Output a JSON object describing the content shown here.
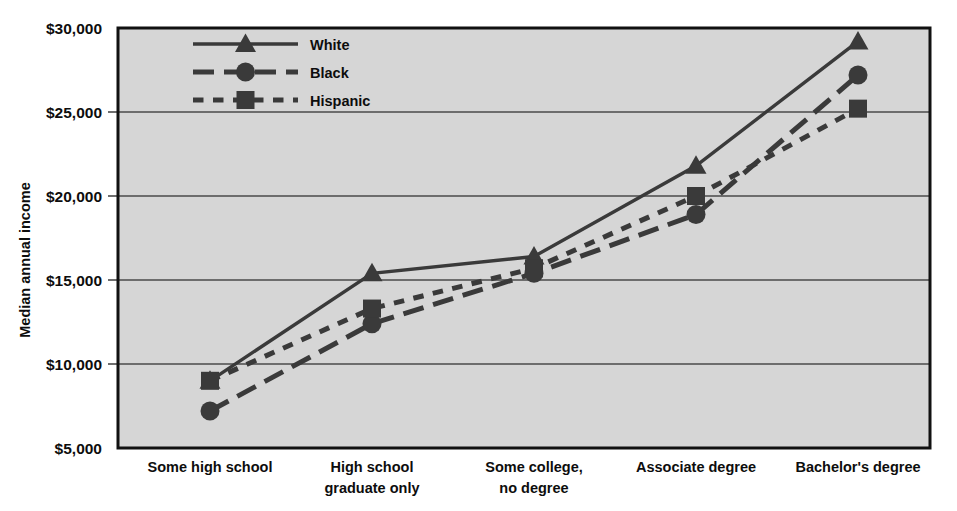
{
  "chart_data": {
    "type": "line",
    "title": "",
    "xlabel": "",
    "ylabel": "Median annual income",
    "ylim": [
      5000,
      30000
    ],
    "ytick_values": [
      5000,
      10000,
      15000,
      20000,
      25000,
      30000
    ],
    "ytick_labels": [
      "$5,000",
      "$10,000",
      "$15,000",
      "$20,000",
      "$25,000",
      "$30,000"
    ],
    "grid": true,
    "grid_axis": "y",
    "legend_position": "top-center",
    "categories": [
      "Some high school",
      "High school graduate only",
      "Some college, no degree",
      "Associate degree",
      "Bachelor's degree"
    ],
    "category_lines": [
      [
        "Some high school"
      ],
      [
        "High school",
        "graduate only"
      ],
      [
        "Some college,",
        "no degree"
      ],
      [
        "Associate degree"
      ],
      [
        "Bachelor's degree"
      ]
    ],
    "series": [
      {
        "name": "White",
        "marker": "triangle",
        "line_style": "solid",
        "color": "#3a3a3a",
        "values": [
          9000,
          15400,
          16400,
          21800,
          29200
        ]
      },
      {
        "name": "Black",
        "marker": "circle",
        "line_style": "long-dash",
        "color": "#3a3a3a",
        "values": [
          7200,
          12400,
          15400,
          18900,
          27200
        ]
      },
      {
        "name": "Hispanic",
        "marker": "square",
        "line_style": "dotted",
        "color": "#3a3a3a",
        "values": [
          9000,
          13300,
          15700,
          20000,
          25200
        ]
      }
    ]
  },
  "colors": {
    "plot_background": "#d6d6d6",
    "plot_border": "#111111",
    "gridline": "#4a4a4a",
    "text": "#0d0d0d",
    "series_ink": "#3a3a3a"
  },
  "legend": {
    "items": [
      {
        "label": "White",
        "marker": "triangle-marker",
        "line_style": "solid"
      },
      {
        "label": "Black",
        "marker": "circle-marker",
        "line_style": "long-dash"
      },
      {
        "label": "Hispanic",
        "marker": "square-marker",
        "line_style": "dotted"
      }
    ]
  }
}
